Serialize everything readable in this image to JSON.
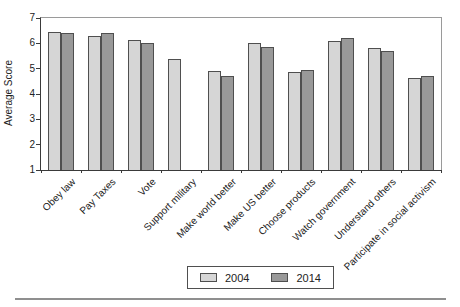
{
  "figure": {
    "background": "#ffffff",
    "text_color": "#222222",
    "axis_color": "#3a3a3a",
    "frame_color": "#9a9a9a",
    "bar_border_color": "#4f4f4f",
    "bottom_rule_color": "#8f8f8f"
  },
  "chart_data": {
    "type": "bar",
    "title": "",
    "xlabel": "",
    "ylabel": "Average Score",
    "ylim": [
      1,
      7
    ],
    "yticks": [
      1,
      2,
      3,
      4,
      5,
      6,
      7
    ],
    "grid": false,
    "legend_position": "bottom-center",
    "categories": [
      "Obey law",
      "Pay Taxes",
      "Vote",
      "Support military",
      "Make world better",
      "Make US better",
      "Choose products",
      "Watch government",
      "Understand others",
      "Participate in social activism"
    ],
    "series": [
      {
        "name": "2004",
        "color": "#d6d6d6",
        "values": [
          6.45,
          6.3,
          6.15,
          5.4,
          4.9,
          6.0,
          4.85,
          6.1,
          5.8,
          4.65
        ]
      },
      {
        "name": "2014",
        "color": "#999999",
        "values": [
          6.4,
          6.4,
          6.0,
          null,
          4.7,
          5.85,
          4.95,
          6.2,
          5.7,
          4.7
        ]
      }
    ]
  }
}
